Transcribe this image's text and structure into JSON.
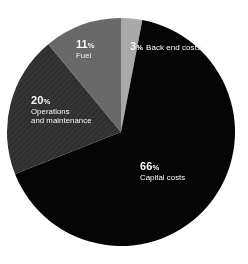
{
  "chart_data": {
    "type": "pie",
    "title": "",
    "subtitle": "",
    "xlabel": "",
    "ylabel": "",
    "legend_position": "none",
    "grid": false,
    "units": "percent",
    "total": 100,
    "start_angle_deg": 0,
    "direction": "clockwise",
    "categories": [
      "Back end costs",
      "Capital costs",
      "Operations and maintenance",
      "Fuel"
    ],
    "values": [
      3,
      66,
      20,
      11
    ],
    "colors": [
      "#a9a9a9",
      "#050505",
      "#2f2f2f",
      "#696969"
    ],
    "slices": [
      {
        "label": "Back end costs",
        "label_line1": "Back end costs",
        "label_line2": "",
        "value": 3,
        "percent_text": "3",
        "percent_symbol": "%",
        "color": "#a9a9a9",
        "textured": false
      },
      {
        "label": "Capital costs",
        "label_line1": "Capital costs",
        "label_line2": "",
        "value": 66,
        "percent_text": "66",
        "percent_symbol": "%",
        "color": "#050505",
        "textured": false
      },
      {
        "label": "Operations and maintenance",
        "label_line1": "Operations",
        "label_line2": "and maintenance",
        "value": 20,
        "percent_text": "20",
        "percent_symbol": "%",
        "color": "#2f2f2f",
        "textured": true
      },
      {
        "label": "Fuel",
        "label_line1": "Fuel",
        "label_line2": "",
        "value": 11,
        "percent_text": "11",
        "percent_symbol": "%",
        "color": "#696969",
        "textured": false
      }
    ]
  },
  "geometry": {
    "center_x": 121,
    "center_y": 132,
    "radius": 114
  },
  "canvas": {
    "background": "#ffffff",
    "label_color": "#ffffff"
  }
}
